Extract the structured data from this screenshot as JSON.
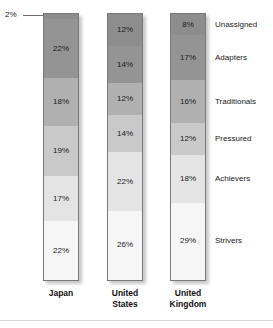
{
  "chart_data": {
    "type": "bar",
    "subtype": "stacked-100-percent",
    "title": "",
    "subtitle": "",
    "xlabel": "",
    "ylabel": "",
    "ylim": [
      0,
      100
    ],
    "grid": false,
    "legend_position": "right-inline-labels",
    "orientation": "vertical",
    "categories": [
      "Japan",
      "United States",
      "United Kingdom"
    ],
    "stack_order_top_to_bottom": [
      "Unassigned",
      "Adapters",
      "Traditionals",
      "Pressured",
      "Achievers",
      "Strivers"
    ],
    "series": [
      {
        "name": "Unassigned",
        "values": [
          2,
          12,
          8
        ],
        "color": "#8d8d8d"
      },
      {
        "name": "Adapters",
        "values": [
          22,
          14,
          17
        ],
        "color": "#949494"
      },
      {
        "name": "Traditionals",
        "values": [
          18,
          12,
          16
        ],
        "color": "#b0b0b0"
      },
      {
        "name": "Pressured",
        "values": [
          19,
          14,
          12
        ],
        "color": "#c9c9c9"
      },
      {
        "name": "Achievers",
        "values": [
          17,
          22,
          18
        ],
        "color": "#e4e4e4"
      },
      {
        "name": "Strivers",
        "values": [
          22,
          26,
          29
        ],
        "color": "#f6f6f6"
      }
    ],
    "annotations": [
      {
        "text": "2%",
        "target_series": "Unassigned",
        "target_category": "Japan",
        "style": "leader-line-callout",
        "position": "outside-left-top"
      }
    ]
  },
  "bars": {
    "japan": {
      "country_line1": "Japan",
      "country_line2": "",
      "segments": [
        {
          "label": "2%",
          "value": 2,
          "show_inside": false
        },
        {
          "label": "22%",
          "value": 22,
          "show_inside": true
        },
        {
          "label": "18%",
          "value": 18,
          "show_inside": true
        },
        {
          "label": "19%",
          "value": 19,
          "show_inside": true
        },
        {
          "label": "17%",
          "value": 17,
          "show_inside": true
        },
        {
          "label": "22%",
          "value": 22,
          "show_inside": true
        }
      ]
    },
    "us": {
      "country_line1": "United",
      "country_line2": "States",
      "segments": [
        {
          "label": "12%",
          "value": 12,
          "show_inside": true
        },
        {
          "label": "14%",
          "value": 14,
          "show_inside": true
        },
        {
          "label": "12%",
          "value": 12,
          "show_inside": true
        },
        {
          "label": "14%",
          "value": 14,
          "show_inside": true
        },
        {
          "label": "22%",
          "value": 22,
          "show_inside": true
        },
        {
          "label": "26%",
          "value": 26,
          "show_inside": true
        }
      ]
    },
    "uk": {
      "country_line1": "United",
      "country_line2": "Kingdom",
      "segments": [
        {
          "label": "8%",
          "value": 8,
          "show_inside": true
        },
        {
          "label": "17%",
          "value": 17,
          "show_inside": true
        },
        {
          "label": "16%",
          "value": 16,
          "show_inside": true
        },
        {
          "label": "12%",
          "value": 12,
          "show_inside": true
        },
        {
          "label": "18%",
          "value": 18,
          "show_inside": true
        },
        {
          "label": "29%",
          "value": 29,
          "show_inside": true
        }
      ]
    }
  },
  "category_labels": [
    {
      "text": "Unassigned"
    },
    {
      "text": "Adapters"
    },
    {
      "text": "Traditionals"
    },
    {
      "text": "Pressured"
    },
    {
      "text": "Achievers"
    },
    {
      "text": "Strivers"
    }
  ],
  "callout": {
    "text": "2%"
  },
  "colors": {
    "unassigned": "#8d8d8d",
    "adapters": "#949494",
    "traditionals": "#b0b0b0",
    "pressured": "#c9c9c9",
    "achievers": "#e4e4e4",
    "strivers": "#f6f6f6",
    "bar_border": "#7a7a7a",
    "text": "#1a1a1a",
    "background": "#ffffff"
  }
}
